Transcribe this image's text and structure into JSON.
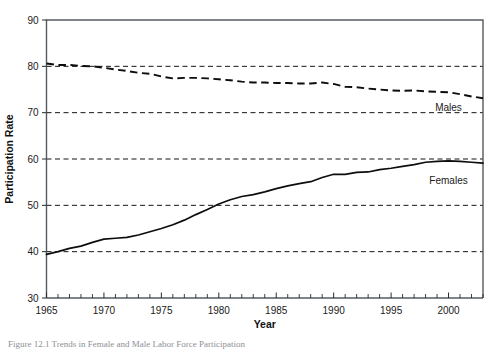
{
  "figure": {
    "caption_partial": "Figure 12.1  Trends in Female and Male Labor Force Participation"
  },
  "chart_data": {
    "type": "line",
    "title": "",
    "xlabel": "Year",
    "ylabel": "Participation Rate",
    "xlim": [
      1965,
      2003
    ],
    "ylim": [
      30,
      90
    ],
    "grid": true,
    "gridlines_y": [
      40,
      50,
      60,
      70,
      80
    ],
    "legend_position": "inline-right",
    "y_ticks": [
      30,
      40,
      50,
      60,
      70,
      80,
      90
    ],
    "y_tick_labels": [
      "30",
      "40",
      "50",
      "60",
      "70",
      "80",
      "90"
    ],
    "x_ticks": [
      1965,
      1970,
      1975,
      1980,
      1985,
      1990,
      1995,
      2000
    ],
    "x_tick_labels": [
      "1965",
      "1970",
      "1975",
      "1980",
      "1985",
      "1990",
      "1995",
      "2000"
    ],
    "x_minor_tick_interval": 1,
    "x": [
      1965,
      1966,
      1967,
      1968,
      1969,
      1970,
      1971,
      1972,
      1973,
      1974,
      1975,
      1976,
      1977,
      1978,
      1979,
      1980,
      1981,
      1982,
      1983,
      1984,
      1985,
      1986,
      1987,
      1988,
      1989,
      1990,
      1991,
      1992,
      1993,
      1994,
      1995,
      1996,
      1997,
      1998,
      1999,
      2000,
      2001,
      2002,
      2003
    ],
    "series": [
      {
        "name": "Males",
        "style": "dashed",
        "label": "Males",
        "color": "#0d0d0d",
        "values": [
          80.6,
          80.3,
          80.3,
          80.1,
          80.0,
          79.7,
          79.3,
          79.0,
          78.6,
          78.4,
          77.8,
          77.4,
          77.5,
          77.5,
          77.4,
          77.2,
          77.0,
          76.7,
          76.5,
          76.5,
          76.4,
          76.4,
          76.3,
          76.3,
          76.5,
          76.2,
          75.6,
          75.5,
          75.2,
          75.0,
          74.8,
          74.7,
          74.8,
          74.6,
          74.5,
          74.4,
          74.0,
          73.5,
          73.1
        ]
      },
      {
        "name": "Females",
        "style": "solid",
        "label": "Females",
        "color": "#0d0d0d",
        "values": [
          39.4,
          40.0,
          40.7,
          41.2,
          42.0,
          42.7,
          42.9,
          43.1,
          43.6,
          44.3,
          45.0,
          45.8,
          46.8,
          48.0,
          49.1,
          50.3,
          51.2,
          51.9,
          52.3,
          52.9,
          53.6,
          54.2,
          54.7,
          55.1,
          56.0,
          56.7,
          56.7,
          57.1,
          57.2,
          57.7,
          58.0,
          58.4,
          58.8,
          59.3,
          59.5,
          59.6,
          59.5,
          59.3,
          59.1
        ]
      }
    ],
    "annotations": [
      {
        "text": "Males",
        "x": 2000,
        "y": 70.4
      },
      {
        "text": "Females",
        "x": 2000,
        "y": 54.6
      }
    ]
  }
}
